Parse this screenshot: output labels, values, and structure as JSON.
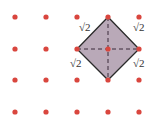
{
  "diagram": {
    "type": "dot-grid-square",
    "grid": {
      "xs": [
        15,
        46,
        77,
        108,
        139
      ],
      "ys": [
        17,
        49,
        80,
        112
      ],
      "dot_color": "#d9463e",
      "dot_radius": 2.6
    },
    "square": {
      "vertices": [
        [
          108,
          17
        ],
        [
          139,
          49
        ],
        [
          108,
          80
        ],
        [
          77,
          49
        ]
      ],
      "fill": "#b9a9b8",
      "stroke": "#2a2a2a",
      "center": [
        108,
        49
      ],
      "diagonals_dashed": true
    },
    "side_labels": [
      {
        "text": "√2",
        "x": 79,
        "y": 27
      },
      {
        "text": "√2",
        "x": 132,
        "y": 27
      },
      {
        "text": "√2",
        "x": 69,
        "y": 57
      },
      {
        "text": "√2",
        "x": 132,
        "y": 57
      }
    ]
  }
}
